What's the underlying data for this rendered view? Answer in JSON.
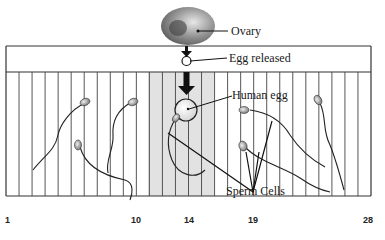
{
  "labels": {
    "ovary": "Ovary",
    "egg_released": "Egg released",
    "human_egg": "Human egg",
    "sperm_cells": "Sperm Cells"
  },
  "axis": {
    "ticks": [
      {
        "day": 1,
        "label": "1"
      },
      {
        "day": 10,
        "label": "10"
      },
      {
        "day": 14,
        "label": "14"
      },
      {
        "day": 19,
        "label": "19"
      },
      {
        "day": 28,
        "label": "28"
      }
    ],
    "total_days": 28,
    "shaded_range_days": [
      12,
      16
    ]
  },
  "colors": {
    "line": "#3a3a3a",
    "shade": "#d6d6d6",
    "arrow": "#111111"
  }
}
